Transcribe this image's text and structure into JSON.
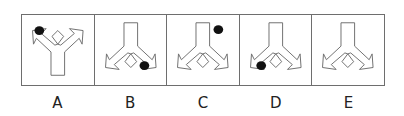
{
  "puzzle": {
    "panels": [
      {
        "label": "A",
        "orientation": "up",
        "dot": {
          "cx": 17,
          "cy": 16
        }
      },
      {
        "label": "B",
        "orientation": "down",
        "dot": {
          "cx": 50,
          "cy": 52
        }
      },
      {
        "label": "C",
        "orientation": "down",
        "dot": {
          "cx": 52,
          "cy": 15
        }
      },
      {
        "label": "D",
        "orientation": "down",
        "dot": {
          "cx": 21,
          "cy": 52
        }
      },
      {
        "label": "E",
        "orientation": "down",
        "dot": null
      }
    ],
    "colors": {
      "line": "#6e6e6e",
      "dot": "#111111",
      "background": "#ffffff"
    }
  }
}
